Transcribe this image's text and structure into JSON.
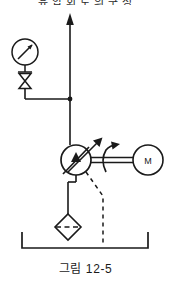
{
  "figure": {
    "caption": "그림 12-5",
    "clipped_header_text": "유 압 회 로 의  구 성"
  },
  "diagram": {
    "type": "hydraulic-schematic",
    "components": [
      {
        "id": "pressure-line-arrow",
        "label": "",
        "symbol": "arrow-up",
        "description": "Pressure outlet line pointing up",
        "x": 70,
        "y": 14
      },
      {
        "id": "pressure-gauge",
        "label": "",
        "symbol": "gauge-circle-needle",
        "description": "Pressure gauge",
        "x": 25,
        "y": 52
      },
      {
        "id": "shutoff-valve",
        "label": "",
        "symbol": "bowtie-valve",
        "description": "Manual shut-off valve",
        "x": 25,
        "y": 80
      },
      {
        "id": "junction-dot",
        "label": "",
        "symbol": "line-junction",
        "description": "Line junction tee",
        "x": 70,
        "y": 99
      },
      {
        "id": "variable-pump",
        "label": "",
        "symbol": "variable-displacement-pump",
        "description": "Variable displacement hydraulic pump",
        "x": 76,
        "y": 160
      },
      {
        "id": "drive-shaft",
        "label": "",
        "symbol": "double-line-shaft",
        "description": "Drive shaft coupling pump to motor",
        "x": 113,
        "y": 160
      },
      {
        "id": "rotation-arrow",
        "label": "",
        "symbol": "curved-rotation-arrow",
        "description": "Shaft rotation direction indicator",
        "x": 112,
        "y": 152
      },
      {
        "id": "electric-motor",
        "label": "M",
        "symbol": "motor-circle",
        "description": "Electric drive motor",
        "x": 148,
        "y": 160
      },
      {
        "id": "suction-filter",
        "label": "",
        "symbol": "filter-diamond-dashed",
        "description": "Suction strainer / filter",
        "x": 68,
        "y": 227
      },
      {
        "id": "drain-line",
        "label": "",
        "symbol": "dashed-pilot-line",
        "description": "Case drain / pilot line to reservoir",
        "x": 103,
        "y": 210
      },
      {
        "id": "reservoir",
        "label": "",
        "symbol": "open-tank",
        "description": "Open hydraulic reservoir / tank",
        "x": 85,
        "y": 243
      }
    ],
    "colors": {
      "line": "#1a1a1a",
      "background": "#ffffff",
      "text": "#1a1a1a"
    },
    "motor_letter": "M"
  }
}
